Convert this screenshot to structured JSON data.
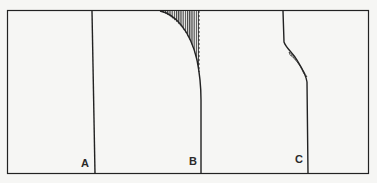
{
  "figure": {
    "frame": {
      "x": 7,
      "y": 10,
      "w": 362,
      "h": 164
    },
    "stroke_color": "#222222",
    "background": "#f6f6f4",
    "panels": [
      {
        "id": "A",
        "label": "A",
        "line_x": 92,
        "profile": "straight vertical",
        "hatched": false
      },
      {
        "id": "B",
        "label": "B",
        "line_x": 201,
        "profile": "concave curve near top, dashed reference line",
        "hatched": true
      },
      {
        "id": "C",
        "label": "C",
        "line_x": 308,
        "profile": "offset step with slanted segment",
        "hatched": true
      }
    ],
    "labels": {
      "a": "A",
      "b": "B",
      "c": "C"
    }
  }
}
